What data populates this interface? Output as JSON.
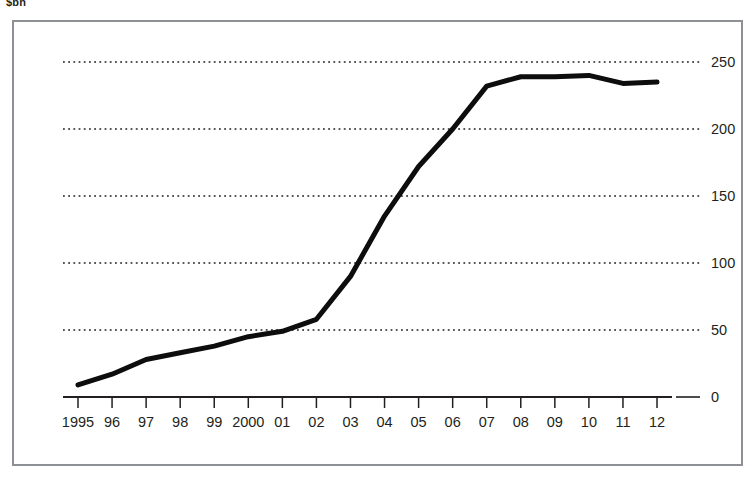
{
  "unit_label": "$bn",
  "chart_data": {
    "type": "line",
    "title": "",
    "subtitle": "",
    "xlabel": "",
    "ylabel": "$bn",
    "categories": [
      "1995",
      "96",
      "97",
      "98",
      "99",
      "2000",
      "01",
      "02",
      "03",
      "04",
      "05",
      "06",
      "07",
      "08",
      "09",
      "10",
      "11",
      "12"
    ],
    "x": [
      1995,
      1996,
      1997,
      1998,
      1999,
      2000,
      2001,
      2002,
      2003,
      2004,
      2005,
      2006,
      2007,
      2008,
      2009,
      2010,
      2011,
      2012
    ],
    "series": [
      {
        "name": "value",
        "values": [
          9,
          17,
          28,
          33,
          38,
          45,
          49,
          58,
          90,
          135,
          172,
          200,
          232,
          239,
          239,
          240,
          234,
          235
        ]
      }
    ],
    "values": [
      9,
      17,
      28,
      33,
      38,
      45,
      49,
      58,
      90,
      135,
      172,
      200,
      232,
      239,
      239,
      240,
      234,
      235
    ],
    "xlim": [
      1995,
      2012
    ],
    "ylim": [
      0,
      262
    ],
    "yticks": [
      0,
      50,
      100,
      150,
      200,
      250
    ],
    "ytick_labels": [
      "0",
      "50",
      "100",
      "150",
      "200",
      "250"
    ],
    "grid": true,
    "grid_style": "dotted-horizontal",
    "grid_color": "#231f20",
    "legend": false,
    "legend_position": "none",
    "line_color": "#0d0d0d",
    "line_width": 5,
    "axis_color": "#231f20",
    "frame_color": "#8d9094",
    "annotations": []
  }
}
